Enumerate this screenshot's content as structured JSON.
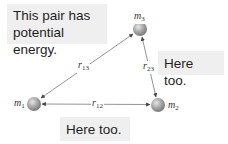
{
  "callouts": {
    "main": "This pair has potential energy.",
    "right": "Here too.",
    "bottom": "Here too."
  },
  "masses": [
    {
      "id": "m1",
      "symbol": "m",
      "sub": "1",
      "cx": 34,
      "cy": 104
    },
    {
      "id": "m2",
      "symbol": "m",
      "sub": "2",
      "cx": 158,
      "cy": 105
    },
    {
      "id": "m3",
      "symbol": "m",
      "sub": "3",
      "cx": 140,
      "cy": 29
    }
  ],
  "distances": [
    {
      "id": "r13",
      "symbol": "r",
      "sub": "13"
    },
    {
      "id": "r12",
      "symbol": "r",
      "sub": "12"
    },
    {
      "id": "r23",
      "symbol": "r",
      "sub": "23"
    }
  ],
  "colors": {
    "sphere_light": "#d8d8d8",
    "sphere_dark": "#8a8a8a",
    "arrow": "#555555",
    "callout_bg": "#efefef"
  }
}
